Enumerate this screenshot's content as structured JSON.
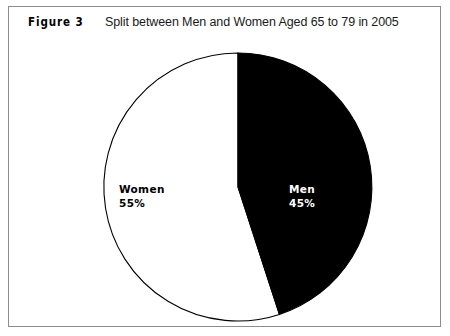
{
  "figure": {
    "number_label": "Figure 3",
    "title": "Split between Men and Women Aged 65 to 79 in 2005"
  },
  "colors": {
    "men_slice": "#000000",
    "women_slice": "#ffffff",
    "outline": "#000000",
    "frame_border": "#8d8d8d",
    "background": "#ffffff",
    "men_label_text": "#ffffff",
    "women_label_text": "#000000"
  },
  "labels": {
    "women": {
      "name": "Women",
      "percent": "55%"
    },
    "men": {
      "name": "Men",
      "percent": "45%"
    }
  },
  "chart_data": {
    "type": "pie",
    "title": "Split between Men and Women Aged 65 to 79 in 2005",
    "categories": [
      "Women",
      "Men"
    ],
    "values": [
      55,
      45
    ],
    "value_labels": [
      "55%",
      "45%"
    ],
    "units": "percent",
    "total": 100,
    "start_angle_deg": 0,
    "direction": "clockwise",
    "slice_colors": [
      "#ffffff",
      "#000000"
    ],
    "legend": "none",
    "data_labels_inside": true,
    "grid": false,
    "xlabel": "",
    "ylabel": ""
  }
}
